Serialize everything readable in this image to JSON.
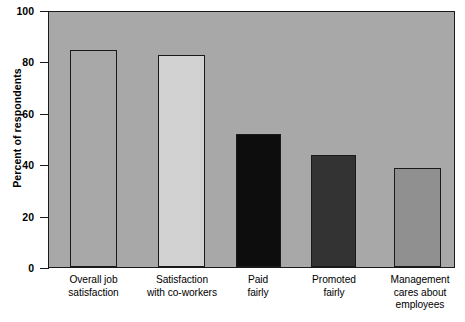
{
  "chart_data": {
    "type": "bar",
    "title": "",
    "xlabel": "",
    "ylabel": "Percent of respondents",
    "categories": [
      "Overall job satisfaction",
      "Satisfaction with co-workers",
      "Paid fairly",
      "Promoted fairly",
      "Management cares about employees"
    ],
    "values": [
      85,
      83,
      52,
      44,
      39
    ],
    "ylim": [
      0,
      100
    ],
    "yticks": [
      0,
      20,
      40,
      60,
      80,
      100
    ],
    "ytick_labels": [
      "0",
      "20",
      "40",
      "60",
      "80",
      "100"
    ],
    "grid": false,
    "legend": "none",
    "plot_background_color": "#a8a8a8",
    "axis_color": "#1a1a1a",
    "bar_colors": [
      "#a8a8a8",
      "#d2d2d2",
      "#0d0d0d",
      "#333333",
      "#909090"
    ],
    "bars": [
      {
        "label": "Overall job satisfaction",
        "label_lines": [
          "Overall job",
          "satisfaction"
        ],
        "value": 85,
        "color": "#a8a8a8"
      },
      {
        "label": "Satisfaction with co-workers",
        "label_lines": [
          "Satisfaction",
          "with co-workers"
        ],
        "value": 83,
        "color": "#d2d2d2"
      },
      {
        "label": "Paid fairly",
        "label_lines": [
          "Paid",
          "fairly"
        ],
        "value": 52,
        "color": "#0d0d0d"
      },
      {
        "label": "Promoted fairly",
        "label_lines": [
          "Promoted",
          "fairly"
        ],
        "value": 44,
        "color": "#333333"
      },
      {
        "label": "Management cares about employees",
        "label_lines": [
          "Management",
          "cares about",
          "employees"
        ],
        "value": 39,
        "color": "#909090"
      }
    ]
  }
}
